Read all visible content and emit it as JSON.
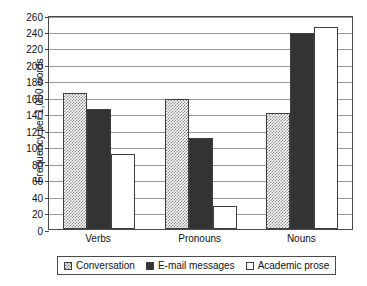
{
  "chart_data": {
    "type": "bar",
    "title": "",
    "xlabel": "",
    "ylabel": "Frequency per 1,000 words",
    "categories": [
      "Verbs",
      "Pronouns",
      "Nouns"
    ],
    "series": [
      {
        "name": "Conversation",
        "values": [
          165,
          158,
          141
        ]
      },
      {
        "name": "E-mail messages",
        "values": [
          146,
          111,
          238
        ]
      },
      {
        "name": "Academic prose",
        "values": [
          91,
          28,
          246
        ]
      }
    ],
    "ylim": [
      0,
      260
    ],
    "ytick_step": 20,
    "yticks": [
      0,
      20,
      40,
      60,
      80,
      100,
      120,
      140,
      160,
      180,
      200,
      220,
      240,
      260
    ],
    "ytick_labels": [
      "0",
      "20",
      "40",
      "60",
      "80",
      "100",
      "120",
      "140",
      "160",
      "180",
      "200",
      "220",
      "240",
      "260"
    ],
    "grid": true,
    "legend_position": "bottom",
    "colors": {
      "conversation": "#8a8a8a",
      "email_messages": "#333333",
      "academic_prose": "#ffffff",
      "axis": "#4a4a4a",
      "gridline": "#9a9a9a",
      "background": "#ffffff"
    }
  }
}
